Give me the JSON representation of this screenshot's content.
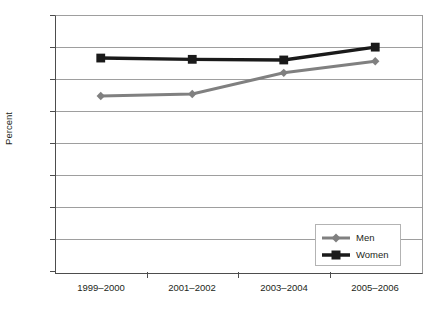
{
  "chart_data": {
    "type": "line",
    "title": "",
    "xlabel": "",
    "ylabel": "Percent",
    "categories": [
      "1999–2000",
      "2001–2002",
      "2003–2004",
      "2005–2006"
    ],
    "series": [
      {
        "name": "Men",
        "values": [
          27.4,
          27.7,
          31.0,
          32.8
        ],
        "color": "#808080",
        "marker": "diamond"
      },
      {
        "name": "Women",
        "values": [
          33.3,
          33.1,
          33.0,
          35.0
        ],
        "color": "#1a1a1a",
        "marker": "square"
      }
    ],
    "ylim": [
      0,
      40
    ],
    "yticks": [
      0,
      5,
      10,
      15,
      20,
      25,
      30,
      35,
      40
    ],
    "ytick_labels": [
      "0",
      "5",
      "10",
      "15",
      "20",
      "25",
      "30",
      "35",
      "40"
    ],
    "grid": true,
    "legend_position": "bottom-right"
  },
  "legend": {
    "entries": [
      {
        "label": "Men"
      },
      {
        "label": "Women"
      }
    ]
  },
  "colors": {
    "men_line": "#808080",
    "women_line": "#1a1a1a",
    "gridline": "#9e9e9e",
    "axis": "#4d4d4d",
    "text": "#231f20",
    "background": "#ffffff"
  }
}
